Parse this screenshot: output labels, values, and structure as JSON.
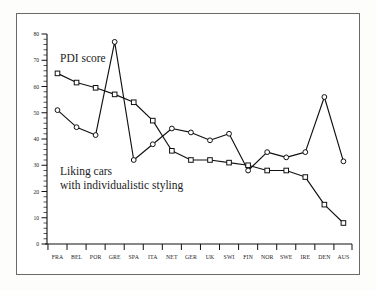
{
  "figure": {
    "background_color": "#fdfdfc",
    "frame_color": "#6a6a6a",
    "ink_color": "#111111"
  },
  "annotations": {
    "pdi_label": "PDI score",
    "liking_label_line1": "Liking cars",
    "liking_label_line2": "with individualistic styling"
  },
  "chart_data": {
    "type": "line",
    "title": "",
    "subtitle": "",
    "xlabel": "",
    "ylabel": "",
    "ylim": [
      0,
      80
    ],
    "xlim_categories": 16,
    "grid": false,
    "legend_position": "inline-annotation",
    "y_ticks": [
      0,
      10,
      20,
      30,
      40,
      50,
      60,
      70,
      80
    ],
    "y_tick_labels": [
      "0",
      "10",
      "20",
      "30",
      "40",
      "50",
      "60",
      "70",
      "80"
    ],
    "y_minor_tick_step": 2,
    "categories": [
      "FRA",
      "BEL",
      "POR",
      "GRE",
      "SPA",
      "ITA",
      "NET",
      "GER",
      "UK",
      "SWI",
      "FIN",
      "NOR",
      "SWE",
      "IRE",
      "DEN",
      "AUS"
    ],
    "series": [
      {
        "name": "PDI score",
        "marker": "circle",
        "values": [
          51,
          44.5,
          41.5,
          77,
          32,
          38,
          44,
          42.5,
          39.5,
          42,
          28,
          35,
          33,
          35,
          56,
          31.5
        ]
      },
      {
        "name": "Liking cars with individualistic styling",
        "marker": "square",
        "values": [
          65,
          61.5,
          59.5,
          57,
          54,
          47,
          35.5,
          32,
          32,
          31,
          30,
          28,
          28,
          25.5,
          15,
          8
        ]
      }
    ]
  }
}
